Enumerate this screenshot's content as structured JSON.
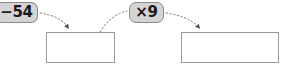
{
  "diagram": {
    "type": "function-machine-flow",
    "operations": [
      {
        "id": "subtract",
        "label": "−54",
        "clipped_left": true
      },
      {
        "id": "multiply",
        "label": "×9",
        "clipped_left": false
      }
    ],
    "answer_boxes": [
      {
        "id": "box-1",
        "value": ""
      },
      {
        "id": "box-2",
        "value": ""
      }
    ],
    "connectors": [
      {
        "id": "arrow-subtract-to-box1",
        "from": "subtract",
        "to": "box-1",
        "style": "dotted",
        "arrowhead": true
      },
      {
        "id": "arc-box1-to-multiply",
        "from": "box-1",
        "to": "multiply",
        "style": "dotted",
        "arrowhead": false
      },
      {
        "id": "arrow-multiply-to-box2",
        "from": "multiply",
        "to": "box-2",
        "style": "dotted",
        "arrowhead": true
      }
    ],
    "colors": {
      "pill_fill": "#d4d4d4",
      "pill_border": "#8a8a8a",
      "box_border": "#9a9a9a",
      "connector": "#7d7d7d",
      "text": "#1a1a1a",
      "background": "#ffffff"
    }
  }
}
